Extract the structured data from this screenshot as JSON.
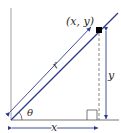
{
  "diagram": {
    "point_label": "(x, y)",
    "r_label": "r",
    "theta_label": "θ",
    "x_label": "x",
    "y_label": "y",
    "colors": {
      "axis": "#555555",
      "line": "#2b3a8c",
      "arrow": "#2b3a8c",
      "dashed": "#666666",
      "point": "#000000"
    }
  }
}
